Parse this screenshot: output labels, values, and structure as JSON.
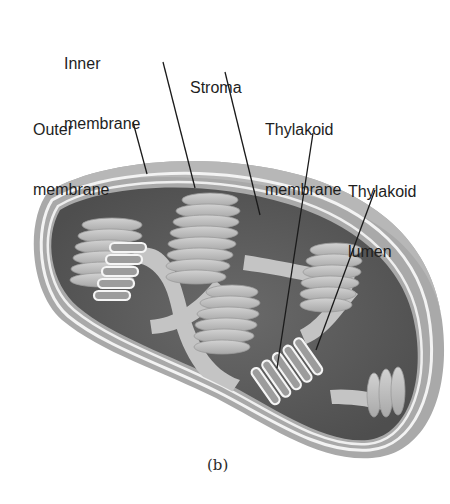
{
  "figure": {
    "caption": "(b)",
    "labels": [
      {
        "id": "inner-membrane",
        "line1": "Inner",
        "line2": "membrane"
      },
      {
        "id": "stroma",
        "line1": "Stroma",
        "line2": ""
      },
      {
        "id": "outer-membrane",
        "line1": "Outer",
        "line2": "membrane"
      },
      {
        "id": "thylakoid-membrane",
        "line1": "Thylakoid",
        "line2": "membrane"
      },
      {
        "id": "thylakoid-lumen",
        "line1": "Thylakoid",
        "line2": "lumen"
      }
    ]
  },
  "colors": {
    "outer_membrane": "#a9a9a9",
    "membrane_gap": "#f2f2f2",
    "stroma": "#5e5e5e",
    "grana": "#bdbdbd",
    "lamellae": "#c8c8c8",
    "leader_line": "#1a1a1a",
    "text": "#1e1e1e"
  }
}
